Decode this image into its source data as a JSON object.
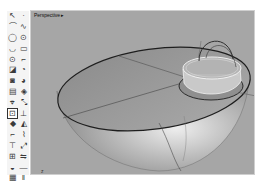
{
  "viewport": {
    "title": "Perspective",
    "title_menu_arrow": "▸",
    "background_color": "#a6a6a6"
  },
  "toolbar": {
    "tools": [
      {
        "name": "select-tool",
        "glyph": "↖"
      },
      {
        "name": "point-tool",
        "glyph": "·"
      },
      {
        "name": "polyline-tool",
        "glyph": "⌒"
      },
      {
        "name": "curve-tool",
        "glyph": "∿"
      },
      {
        "name": "circle-tool",
        "glyph": "◯"
      },
      {
        "name": "ellipse-tool",
        "glyph": "⊙"
      },
      {
        "name": "arc-tool",
        "glyph": "◡"
      },
      {
        "name": "rectangle-tool",
        "glyph": "▭"
      },
      {
        "name": "polygon-tool",
        "glyph": "⊙"
      },
      {
        "name": "fillet-curve-tool",
        "glyph": "⌐"
      },
      {
        "name": "surface-tool",
        "glyph": "◪"
      },
      {
        "name": "loft-tool",
        "glyph": "◔"
      },
      {
        "name": "box-tool",
        "glyph": "◙"
      },
      {
        "name": "sphere-tool",
        "glyph": "◕"
      },
      {
        "name": "extrude-tool",
        "glyph": "▤"
      },
      {
        "name": "boolean-tool",
        "glyph": "◈"
      },
      {
        "name": "mesh-tool",
        "glyph": "⌖"
      },
      {
        "name": "transform-tool",
        "glyph": "⤡"
      },
      {
        "name": "dimension-tool",
        "glyph": "⊡"
      },
      {
        "name": "split-tool",
        "glyph": "⊥"
      },
      {
        "name": "render-tool",
        "glyph": "◆"
      },
      {
        "name": "analyze-tool",
        "glyph": "◭"
      },
      {
        "name": "trim-tool",
        "glyph": "⌐"
      },
      {
        "name": "join-tool",
        "glyph": "⌇"
      },
      {
        "name": "explode-tool",
        "glyph": "⊤"
      },
      {
        "name": "move-tool",
        "glyph": "⤢"
      },
      {
        "name": "array-tool",
        "glyph": "⊞"
      },
      {
        "name": "mirror-tool",
        "glyph": "⇋"
      },
      {
        "name": "layer-tool",
        "glyph": "◒"
      },
      {
        "name": "hide-tool",
        "glyph": "—"
      },
      {
        "name": "grid-tool",
        "glyph": "▦"
      },
      {
        "name": "properties-tool",
        "glyph": "ǁ"
      }
    ],
    "active_tool_index": 18
  },
  "scene": {
    "description": "Half-sphere bowl with elliptical rim and a cylindrical cup with handle arc",
    "axis_label": "z"
  }
}
